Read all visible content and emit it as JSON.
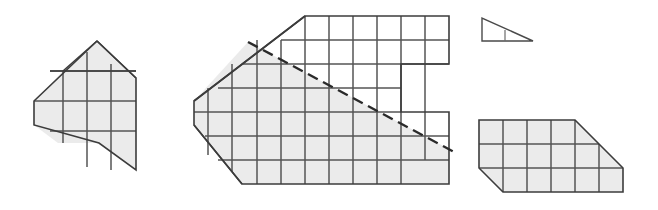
{
  "figure": {
    "title": "Dissection puzzle figure with four grid-ruled polygons",
    "canvas": {
      "width": 658,
      "height": 210,
      "background": "#ffffff"
    },
    "palette": {
      "shaded_fill": "#ebebeb",
      "plain_fill": "#ffffff",
      "outline_stroke": "#3c3c3c",
      "grid_stroke": "#555555",
      "cut_line_stroke": "#2a2a2a"
    },
    "grid": {
      "cell_size": 24,
      "units": "px"
    },
    "shapes": [
      {
        "id": "shape-1",
        "name": "pentagon-left",
        "label": "Left pentagon with pointed left vertex and apex",
        "fill": "shaded",
        "outline": "34,101 65,69 97,41 136,78 136,170 99,143",
        "grid_cells_visible": 9,
        "bounds": {
          "x": 34,
          "y": 41,
          "width": 102,
          "height": 129
        }
      },
      {
        "id": "shape-2",
        "name": "notched-hexagon-center",
        "label": "Large center polygon with notch on the right side and dashed cut line",
        "fill": "mixed",
        "outline": "194,101 257,40 305,16 449,16 449,64 401,64 401,112 449,112 449,184 305,184 242,184",
        "grid_cells_visible": 30,
        "bounds": {
          "x": 194,
          "y": 16,
          "width": 255,
          "height": 168
        },
        "shaded_region": "below the dashed cut line",
        "cut_line": {
          "from": "248,42",
          "to": "456,153",
          "style": "dashed"
        }
      },
      {
        "id": "shape-3",
        "name": "small-right-triangle",
        "label": "Small right triangle with one vertical divider",
        "fill": "plain",
        "outline": "482,18 482,41 533,41",
        "grid_cells_visible": 1,
        "bounds": {
          "x": 482,
          "y": 18,
          "width": 51,
          "height": 23
        }
      },
      {
        "id": "shape-4",
        "name": "beveled-trapezoid-right",
        "label": "Right trapezoid block with bevelled lower-left corner and sloped right edge",
        "fill": "shaded",
        "outline": "479,120 575,120 623,168 623,192 503,192 479,168",
        "grid_cells_visible": 12,
        "bounds": {
          "x": 479,
          "y": 120,
          "width": 144,
          "height": 72
        }
      }
    ]
  }
}
